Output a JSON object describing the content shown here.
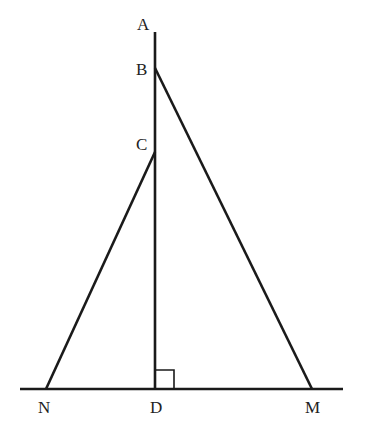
{
  "diagram": {
    "type": "geometry-figure",
    "colors": {
      "line": "#1a1a1a",
      "label": "#222222",
      "background": "#ffffff"
    },
    "points": {
      "A": {
        "label": "A",
        "x": 155,
        "y": 32
      },
      "B": {
        "label": "B",
        "x": 155,
        "y": 68
      },
      "C": {
        "label": "C",
        "x": 155,
        "y": 152
      },
      "D": {
        "label": "D",
        "x": 155,
        "y": 389
      },
      "N": {
        "label": "N",
        "x": 46,
        "y": 389
      },
      "M": {
        "label": "M",
        "x": 312,
        "y": 389
      }
    },
    "segments": [
      {
        "name": "AD",
        "from": "A",
        "to": "D"
      },
      {
        "name": "BM",
        "from": "B",
        "to": "M"
      },
      {
        "name": "CN",
        "from": "C",
        "to": "N"
      },
      {
        "name": "ground-line",
        "from": "N",
        "to": "M",
        "extended": true
      }
    ],
    "right_angle_marker": {
      "at": "D",
      "between": [
        "AD",
        "DM"
      ]
    }
  }
}
